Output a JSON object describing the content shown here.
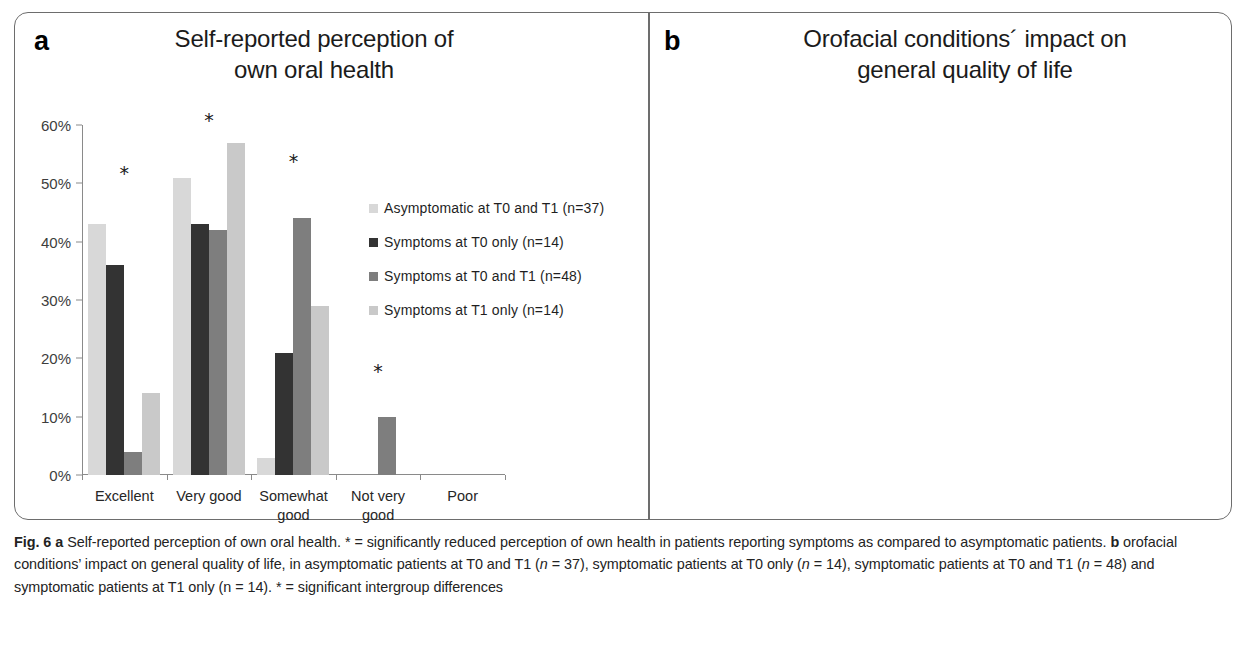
{
  "figure": {
    "panel_a_letter": "a",
    "panel_b_letter": "b",
    "caption_prefix": "Fig. 6",
    "caption": "Fig. 6 a Self-reported perception of own oral health. * = significantly reduced perception of own health in patients reporting symptoms as compared to asymptomatic patients. b orofacial conditions’ impact on general quality of life, in asymptomatic patients at T0 and T1 (n = 37), symptomatic patients at T0 only (n = 14), symptomatic patients at T0 and T1 (n = 48) and symptomatic patients at T1 only (n = 14). * = significant intergroup differences",
    "caption_parts": {
      "p1": "Fig. 6",
      "p2": "a",
      "p3": " Self-reported perception of own oral health. * = significantly reduced perception of own health in patients reporting symptoms as compared to asymptomatic patients. ",
      "p4": "b",
      "p5": " orofacial conditions’ impact on general quality of life, in asymptomatic patients at T0 and T1 (",
      "p6": "n",
      "p7": " = 37), symptomatic patients at T0 only (",
      "p8": "n",
      "p9": " = 14), symptomatic patients at T0 and T1 (",
      "p10": "n",
      "p11": " = 48) and symptomatic patients at T1 only (n = 14). * = significant intergroup differences"
    }
  },
  "legend": {
    "items": [
      {
        "label": "Asymptomatic at T0 and T1 (n=37)",
        "color": "#d8d8d8"
      },
      {
        "label": "Symptoms at T0 only (n=14)",
        "color": "#333333"
      },
      {
        "label": "Symptoms at T0 and T1 (n=48)",
        "color": "#7e7e7e"
      },
      {
        "label": "Symptoms at T1 only (n=14)",
        "color": "#c9c9c9"
      }
    ]
  },
  "chart_data": [
    {
      "id": "a",
      "type": "bar",
      "title": "Self-reported perception of\nown oral health",
      "title_line1": "Self-reported perception of",
      "title_line2": "own oral health",
      "xlabel": "",
      "ylabel": "",
      "ylim": [
        0,
        60
      ],
      "ytick_labels": [
        "0%",
        "10%",
        "20%",
        "30%",
        "40%",
        "50%",
        "60%"
      ],
      "ytick_values": [
        0,
        10,
        20,
        30,
        40,
        50,
        60
      ],
      "grid": false,
      "legend_position": "right",
      "categories": [
        "Excellent",
        "Very good",
        "Somewhat good",
        "Not very good",
        "Poor"
      ],
      "category_lines": [
        [
          "Excellent"
        ],
        [
          "Very good"
        ],
        [
          "Somewhat",
          "good"
        ],
        [
          "Not very",
          "good"
        ],
        [
          "Poor"
        ]
      ],
      "series": [
        {
          "name": "Asymptomatic at T0 and T1 (n=37)",
          "color": "#d8d8d8",
          "values": [
            43,
            51,
            3,
            0,
            0
          ]
        },
        {
          "name": "Symptoms at T0 only (n=14)",
          "color": "#333333",
          "values": [
            36,
            43,
            21,
            0,
            0
          ]
        },
        {
          "name": "Symptoms at T0 and T1 (n=48)",
          "color": "#7e7e7e",
          "values": [
            4,
            42,
            44,
            10,
            0
          ]
        },
        {
          "name": "Symptoms at T1 only (n=14)",
          "color": "#c9c9c9",
          "values": [
            14,
            57,
            29,
            0,
            0
          ]
        }
      ],
      "annotations": [
        {
          "text": "*",
          "category": "Excellent",
          "y": 51
        },
        {
          "text": "*",
          "category": "Very good",
          "y": 60
        },
        {
          "text": "*",
          "category": "Somewhat good",
          "y": 53
        },
        {
          "text": "*",
          "category": "Not very good",
          "y": 17
        }
      ]
    },
    {
      "id": "b",
      "type": "bar",
      "title": "Orofacial conditions´ impact on\ngeneral quality of life",
      "title_line1": "Orofacial conditions´ impact on",
      "title_line2": "general quality of life",
      "xlabel": "",
      "ylabel": "",
      "ylim": [
        0,
        100
      ],
      "ytick_labels": [
        "0%",
        "10%",
        "20%",
        "30%",
        "40%",
        "50%",
        "60%",
        "70%",
        "80%",
        "90%",
        "100%"
      ],
      "ytick_values": [
        0,
        10,
        20,
        30,
        40,
        50,
        60,
        70,
        80,
        90,
        100
      ],
      "grid": false,
      "legend_position": "right",
      "categories": [
        "Not at all",
        "A little",
        "Some",
        "A lot",
        "Very much"
      ],
      "category_lines": [
        [
          "Not at all"
        ],
        [
          "A little"
        ],
        [
          "Some"
        ],
        [
          "A lot"
        ],
        [
          "Very much"
        ]
      ],
      "series": [
        {
          "name": "Asymptomatic at T0 and T1 (n=37)",
          "color": "#d8d8d8",
          "values": [
            86,
            11,
            0,
            0,
            0
          ]
        },
        {
          "name": "Symptoms at T0 only (n=14)",
          "color": "#333333",
          "values": [
            57,
            43,
            0,
            0,
            0
          ]
        },
        {
          "name": "Symptoms at T0 and T1 (n=48)",
          "color": "#7e7e7e",
          "values": [
            21,
            50,
            21,
            1.5,
            5.5
          ]
        },
        {
          "name": "Symptoms at T1 only (n=14)",
          "color": "#c9c9c9",
          "values": [
            29,
            63.5,
            6.5,
            0,
            0
          ]
        }
      ],
      "annotations": [
        {
          "text": "*",
          "category": "Not at all",
          "pair": [
            0,
            1
          ],
          "y": 91
        },
        {
          "text": "*",
          "category": "Not at all",
          "pair": [
            2,
            3
          ],
          "y": 34
        },
        {
          "text": "*",
          "category": "A little",
          "pair": [
            0,
            1
          ],
          "y": 48
        },
        {
          "text": "*",
          "category": "A little",
          "pair": [
            2,
            3
          ],
          "y": 68
        },
        {
          "text": "*",
          "category": "Some",
          "pair": [
            2,
            3
          ],
          "y": 26
        },
        {
          "text": "*",
          "category": "A lot",
          "pair": [
            2,
            3
          ],
          "y": 7
        },
        {
          "text": "*",
          "category": "Very much",
          "pair": [
            2,
            3
          ],
          "y": 11
        }
      ]
    }
  ]
}
